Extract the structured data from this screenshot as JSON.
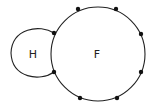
{
  "diagram": {
    "type": "graph-regions",
    "stroke_color": "#222222",
    "vertex_color": "#111111",
    "regions": [
      {
        "id": "H",
        "label": "H"
      },
      {
        "id": "F",
        "label": "F"
      }
    ],
    "vertex_count": 8,
    "vertices_on_F": 8,
    "shared_vertices_H_F": 2
  }
}
